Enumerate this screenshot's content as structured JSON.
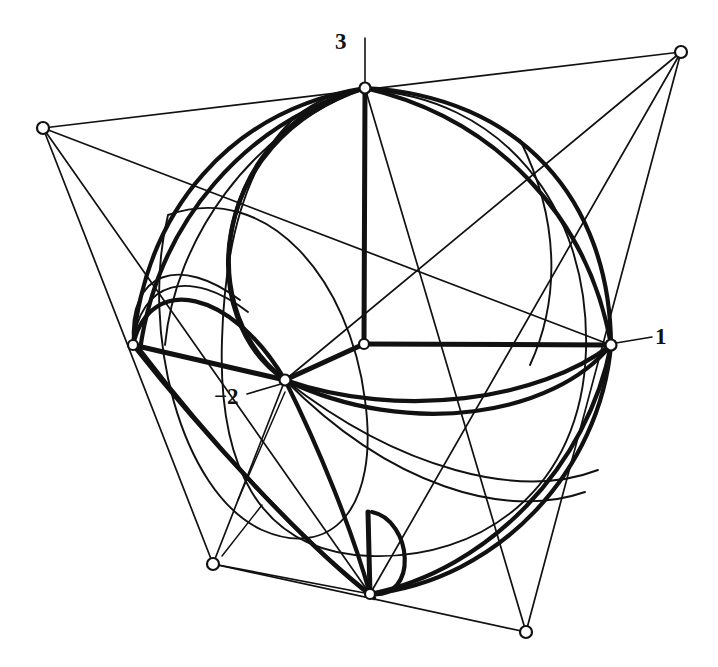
{
  "figure": {
    "background_color": "#ffffff",
    "ink_color": "#111111",
    "width": 718,
    "height": 667
  },
  "labels": {
    "top": "3",
    "right": "1",
    "inner": "−2"
  },
  "nodes": [
    {
      "name": "branch-point-3",
      "x": 365,
      "y": 88,
      "label": "3",
      "r": 5.5
    },
    {
      "name": "branch-point-1",
      "x": 611,
      "y": 345,
      "label": "1",
      "r": 5.5
    },
    {
      "name": "branch-point-minus-2",
      "x": 285,
      "y": 380,
      "label": "−2",
      "r": 5.5
    },
    {
      "name": "center-node",
      "x": 364,
      "y": 344,
      "label": "",
      "r": 5.0
    },
    {
      "name": "left-node",
      "x": 133,
      "y": 345,
      "label": "",
      "r": 5.0
    },
    {
      "name": "bottom-node",
      "x": 370,
      "y": 594,
      "label": "",
      "r": 5.0
    },
    {
      "name": "quad-vertex-top-left",
      "x": 43,
      "y": 128,
      "label": "",
      "r": 6.0
    },
    {
      "name": "quad-vertex-top-right",
      "x": 681,
      "y": 52,
      "label": "",
      "r": 6.0
    },
    {
      "name": "quad-vertex-bottom-left",
      "x": 213,
      "y": 564,
      "label": "",
      "r": 6.0
    },
    {
      "name": "quad-vertex-bottom-right",
      "x": 526,
      "y": 632,
      "label": "",
      "r": 6.0
    }
  ],
  "leader_lines": [
    {
      "name": "leader-3",
      "x1": 365,
      "y1": 83,
      "x2": 365,
      "y2": 38
    },
    {
      "name": "leader-1",
      "x1": 616,
      "y1": 343,
      "x2": 652,
      "y2": 337
    },
    {
      "name": "leader-m2",
      "x1": 281,
      "y1": 384,
      "x2": 247,
      "y2": 394
    }
  ],
  "quad_edges": [
    {
      "name": "quad-edge-top",
      "x1": 43,
      "y1": 128,
      "x2": 681,
      "y2": 52
    },
    {
      "name": "quad-edge-right",
      "x1": 681,
      "y1": 52,
      "x2": 526,
      "y2": 632
    },
    {
      "name": "quad-edge-bottom",
      "x1": 526,
      "y1": 632,
      "x2": 213,
      "y2": 564
    },
    {
      "name": "quad-edge-left",
      "x1": 213,
      "y1": 564,
      "x2": 43,
      "y2": 128
    }
  ],
  "chords": [
    {
      "name": "chord-tl-to-1",
      "x1": 43,
      "y1": 128,
      "x2": 611,
      "y2": 345
    },
    {
      "name": "chord-tr-to-bn",
      "x1": 681,
      "y1": 52,
      "x2": 370,
      "y2": 594
    },
    {
      "name": "chord-tr-to-m2",
      "x1": 681,
      "y1": 52,
      "x2": 285,
      "y2": 380
    },
    {
      "name": "chord-br-to-3",
      "x1": 526,
      "y1": 632,
      "x2": 365,
      "y2": 88
    },
    {
      "name": "chord-bl-to-m2",
      "x1": 213,
      "y1": 564,
      "x2": 285,
      "y2": 380
    },
    {
      "name": "chord-bl-to-bn",
      "x1": 213,
      "y1": 564,
      "x2": 370,
      "y2": 594
    },
    {
      "name": "chord-tl-to-bn",
      "x1": 43,
      "y1": 128,
      "x2": 370,
      "y2": 594
    }
  ],
  "spokes": [
    {
      "name": "spoke-center-to-3",
      "x1": 364,
      "y1": 344,
      "x2": 365,
      "y2": 88
    },
    {
      "name": "spoke-center-to-1",
      "x1": 364,
      "y1": 344,
      "x2": 611,
      "y2": 345
    },
    {
      "name": "spoke-center-to-m2",
      "x1": 364,
      "y1": 344,
      "x2": 285,
      "y2": 380
    },
    {
      "name": "spoke-left-to-center",
      "x1": 133,
      "y1": 345,
      "x2": 285,
      "y2": 380
    },
    {
      "name": "spoke-bottom-stub",
      "x1": 370,
      "y1": 594,
      "x2": 368,
      "y2": 512
    }
  ],
  "thick_arcs": [
    {
      "name": "thick-arc-3-to-1-outer",
      "d": "M 365 88 C 520 96 610 200 611 345"
    },
    {
      "name": "thick-arc-3-to-1-inner",
      "d": "M 365 88 C 495 118 588 215 611 345"
    },
    {
      "name": "thick-arc-3-to-left",
      "d": "M 365 88 C 230 110 146 210 133 345"
    },
    {
      "name": "thick-arc-3-to-left-2",
      "d": "M 365 88 C 245 122 158 222 140 350"
    },
    {
      "name": "thick-arc-3-to-m2",
      "d": "M 365 88 C 228 120 182 300 285 380"
    },
    {
      "name": "thick-arc-3-to-m2-b",
      "d": "M 365 88 C 205 140 195 320 285 380"
    },
    {
      "name": "thick-arc-left-to-m2",
      "d": "M 133 345 C 150 272 232 290 285 380"
    },
    {
      "name": "thick-arc-left-to-bn",
      "d": "M 133 345 C 200 430 300 540 370 594"
    },
    {
      "name": "thick-arc-left-to-bn-2",
      "d": "M 140 350 C 206 437 305 545 374 598"
    },
    {
      "name": "thick-arc-m2-to-bn",
      "d": "M 285 380 C 320 450 352 530 370 594"
    },
    {
      "name": "thick-arc-m2-to-1",
      "d": "M 285 380 C 400 420 540 400 611 345"
    },
    {
      "name": "thick-arc-m2-to-1-b",
      "d": "M 285 380 C 410 440 555 415 611 345"
    },
    {
      "name": "thick-arc-bn-to-1",
      "d": "M 370 594 C 500 580 600 470 611 345"
    },
    {
      "name": "thick-arc-bn-to-1-b",
      "d": "M 370 594 C 490 570 588 465 611 345"
    },
    {
      "name": "thick-arc-bn-cusp",
      "d": "M 370 594 C 420 600 412 520 372 512"
    }
  ],
  "thin_curves": [
    {
      "name": "thin-circle-main",
      "d": "M 365 90 C 500 96 590 205 586 350 C 582 490 480 560 370 556 C 255 552 218 460 222 340 C 226 200 270 95 365 90 Z"
    },
    {
      "name": "thin-ellipse-inner",
      "d": "M 168 215 C 268 180 350 280 365 400 C 380 510 330 560 262 530 C 180 492 140 330 168 215 Z"
    },
    {
      "name": "thin-arc-left-lobe",
      "d": "M 133 345 C 128 270 180 255 240 300"
    },
    {
      "name": "thin-arc-left-lobe-2",
      "d": "M 133 345 C 140 280 190 268 248 312"
    },
    {
      "name": "thin-arc-right-lower",
      "d": "M 285 380 C 400 470 520 500 598 470"
    },
    {
      "name": "thin-arc-right-lower-2",
      "d": "M 285 380 C 390 486 505 520 585 492"
    },
    {
      "name": "thin-arc-top-left-swoop",
      "d": "M 365 88 C 250 130 175 240 165 345"
    },
    {
      "name": "thin-arc-mid-right",
      "d": "M 520 140 C 560 220 560 300 530 365"
    }
  ],
  "rays": [
    {
      "name": "ray-from-m2-down",
      "x1": 285,
      "y1": 392,
      "x2": 238,
      "y2": 500
    },
    {
      "name": "ray-to-bottom-left",
      "x1": 222,
      "y1": 556,
      "x2": 262,
      "y2": 505
    }
  ]
}
